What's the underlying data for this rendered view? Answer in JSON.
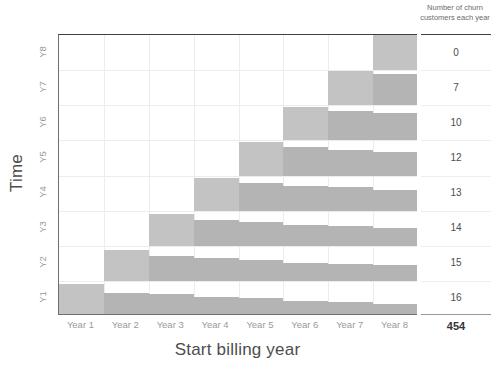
{
  "chart_data": {
    "type": "bar",
    "title": "",
    "subtitle": "",
    "xlabel": "Start billing year",
    "ylabel": "Time",
    "categories": [
      "Year 1",
      "Year 2",
      "Year 3",
      "Year 4",
      "Year 5",
      "Year 6",
      "Year 7",
      "Year 8"
    ],
    "row_labels": [
      "Y1",
      "Y2",
      "Y3",
      "Y4",
      "Y5",
      "Y6",
      "Y7",
      "Y8"
    ],
    "grid": true,
    "legend": "none",
    "orientation": "horizontal-bands",
    "series": [
      {
        "name": "Y1",
        "values": [
          0.92,
          0.66,
          0.62,
          0.55,
          0.5,
          0.42,
          0.4,
          0.33
        ]
      },
      {
        "name": "Y2",
        "values": [
          0.0,
          0.88,
          0.72,
          0.66,
          0.6,
          0.52,
          0.48,
          0.45
        ]
      },
      {
        "name": "Y3",
        "values": [
          0.0,
          0.0,
          0.9,
          0.74,
          0.68,
          0.6,
          0.56,
          0.52
        ]
      },
      {
        "name": "Y4",
        "values": [
          0.0,
          0.0,
          0.0,
          0.92,
          0.78,
          0.7,
          0.66,
          0.6
        ]
      },
      {
        "name": "Y5",
        "values": [
          0.0,
          0.0,
          0.0,
          0.0,
          0.94,
          0.8,
          0.74,
          0.68
        ]
      },
      {
        "name": "Y6",
        "values": [
          0.0,
          0.0,
          0.0,
          0.0,
          0.0,
          0.96,
          0.84,
          0.78
        ]
      },
      {
        "name": "Y7",
        "values": [
          0.0,
          0.0,
          0.0,
          0.0,
          0.0,
          0.0,
          0.98,
          0.88
        ]
      },
      {
        "name": "Y8",
        "values": [
          0.0,
          0.0,
          0.0,
          0.0,
          0.0,
          0.0,
          0.0,
          1.0
        ]
      }
    ],
    "churn_header": "Number of churn customers each year",
    "churn_values": [
      "0",
      "7",
      "10",
      "12",
      "13",
      "14",
      "15",
      "16"
    ],
    "churn_total": "454",
    "colors": {
      "bar": "#b4b4b4",
      "bar_light": "#c3c3c3",
      "grid": "#ececec",
      "axis": "#6e6e6e",
      "tick_text": "#9a9a9a",
      "title_text": "#4d4d4d"
    }
  }
}
